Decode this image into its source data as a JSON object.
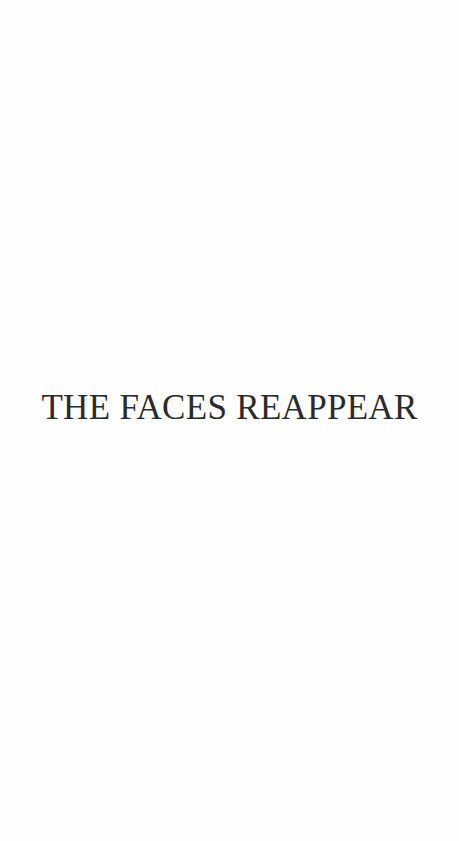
{
  "page": {
    "chapter_title": "THE FACES REAPPEAR",
    "colors": {
      "background": "#fefefe",
      "text": "#2b2b2b"
    }
  }
}
